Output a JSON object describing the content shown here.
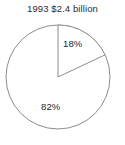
{
  "chart_data": {
    "type": "pie",
    "title": "1993 $2.4 billion",
    "xlabel": "",
    "ylabel": "",
    "grid": false,
    "legend": false,
    "legend_position": "none",
    "start_angle_deg": 0,
    "direction": "clockwise",
    "total_label": "$2.4 billion",
    "year": "1993",
    "categories": [
      "18%",
      "82%"
    ],
    "values": [
      18,
      82
    ],
    "labels": [
      "18%",
      "82%"
    ],
    "slices": [
      {
        "label": "18%",
        "value": 18,
        "fill": "#ffffff",
        "stroke": "#8c8c8c",
        "label_x": 63,
        "label_y": 38
      },
      {
        "label": "82%",
        "value": 82,
        "fill": "#ffffff",
        "stroke": "#8c8c8c",
        "label_x": 41,
        "label_y": 101
      }
    ],
    "geometry": {
      "center_x": 58,
      "center_y": 77,
      "radius": 52
    },
    "colors": {
      "background": "#ffffff",
      "outline": "#8c8c8c",
      "divider": "#8c8c8c",
      "text": "#1f1f1f",
      "title_text": "#2b2b2b"
    }
  }
}
